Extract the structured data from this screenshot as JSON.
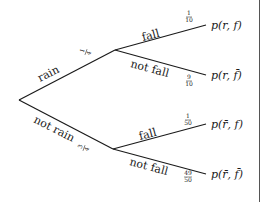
{
  "diagram": {
    "type": "probability-tree",
    "root": {
      "branches": [
        {
          "label": "rain",
          "prob_num": "1",
          "prob_den": "4",
          "children": [
            {
              "label": "fall",
              "prob_num": "1",
              "prob_den": "10",
              "outcome": "p(r, f)"
            },
            {
              "label": "not fall",
              "prob_num": "9",
              "prob_den": "10",
              "outcome": "p(r, f̄)"
            }
          ]
        },
        {
          "label": "not rain",
          "prob_num": "3",
          "prob_den": "4",
          "children": [
            {
              "label": "fall",
              "prob_num": "1",
              "prob_den": "50",
              "outcome": "p(r̄, f)"
            },
            {
              "label": "not fall",
              "prob_num": "49",
              "prob_den": "50",
              "outcome": "p(r̄, f̄)"
            }
          ]
        }
      ]
    },
    "colors": {
      "line": "#1a1a1a",
      "background": "#ffffff",
      "border": "#555555"
    }
  }
}
